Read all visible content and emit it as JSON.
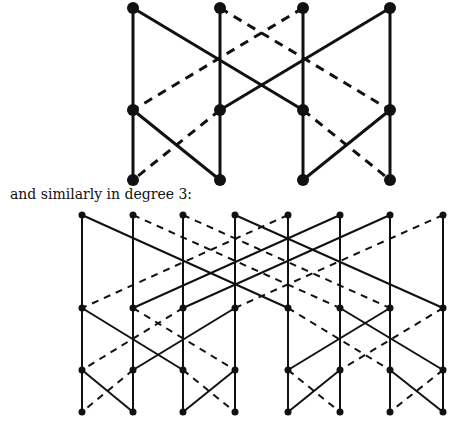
{
  "caption": "and similarly in degree 3:",
  "colors": {
    "ink": "#111111",
    "background": "#ffffff"
  },
  "diagrams": [
    {
      "name": "degree-2",
      "node_radius": 6,
      "stroke_width": 3,
      "dash": "9,7",
      "columns": [
        133,
        220,
        303,
        390
      ],
      "rows": [
        8,
        110,
        180
      ],
      "edges": [
        {
          "from": [
            0,
            0
          ],
          "to": [
            0,
            1
          ],
          "style": "solid"
        },
        {
          "from": [
            0,
            1
          ],
          "to": [
            0,
            2
          ],
          "style": "solid"
        },
        {
          "from": [
            1,
            0
          ],
          "to": [
            1,
            1
          ],
          "style": "solid"
        },
        {
          "from": [
            1,
            1
          ],
          "to": [
            1,
            2
          ],
          "style": "solid"
        },
        {
          "from": [
            2,
            0
          ],
          "to": [
            2,
            1
          ],
          "style": "solid"
        },
        {
          "from": [
            2,
            1
          ],
          "to": [
            2,
            2
          ],
          "style": "solid"
        },
        {
          "from": [
            3,
            0
          ],
          "to": [
            3,
            1
          ],
          "style": "solid"
        },
        {
          "from": [
            3,
            1
          ],
          "to": [
            3,
            2
          ],
          "style": "solid"
        },
        {
          "from": [
            0,
            0
          ],
          "to": [
            2,
            1
          ],
          "style": "solid"
        },
        {
          "from": [
            3,
            0
          ],
          "to": [
            1,
            1
          ],
          "style": "solid"
        },
        {
          "from": [
            1,
            0
          ],
          "to": [
            3,
            1
          ],
          "style": "dashed"
        },
        {
          "from": [
            2,
            0
          ],
          "to": [
            0,
            1
          ],
          "style": "dashed"
        },
        {
          "from": [
            0,
            1
          ],
          "to": [
            1,
            2
          ],
          "style": "solid"
        },
        {
          "from": [
            1,
            1
          ],
          "to": [
            0,
            2
          ],
          "style": "dashed"
        },
        {
          "from": [
            3,
            1
          ],
          "to": [
            2,
            2
          ],
          "style": "solid"
        },
        {
          "from": [
            2,
            1
          ],
          "to": [
            3,
            2
          ],
          "style": "dashed"
        }
      ]
    },
    {
      "name": "degree-3",
      "node_radius": 3.5,
      "stroke_width": 2,
      "dash": "7,6",
      "columns": [
        82,
        133,
        183,
        235,
        288,
        340,
        390,
        443
      ],
      "rows": [
        215,
        308,
        370,
        412
      ],
      "edges": [
        {
          "from": [
            0,
            0
          ],
          "to": [
            0,
            1
          ],
          "style": "solid"
        },
        {
          "from": [
            0,
            1
          ],
          "to": [
            0,
            2
          ],
          "style": "solid"
        },
        {
          "from": [
            0,
            2
          ],
          "to": [
            0,
            3
          ],
          "style": "solid"
        },
        {
          "from": [
            1,
            0
          ],
          "to": [
            1,
            1
          ],
          "style": "solid"
        },
        {
          "from": [
            1,
            1
          ],
          "to": [
            1,
            2
          ],
          "style": "solid"
        },
        {
          "from": [
            1,
            2
          ],
          "to": [
            1,
            3
          ],
          "style": "solid"
        },
        {
          "from": [
            2,
            0
          ],
          "to": [
            2,
            1
          ],
          "style": "solid"
        },
        {
          "from": [
            2,
            1
          ],
          "to": [
            2,
            2
          ],
          "style": "solid"
        },
        {
          "from": [
            2,
            2
          ],
          "to": [
            2,
            3
          ],
          "style": "solid"
        },
        {
          "from": [
            3,
            0
          ],
          "to": [
            3,
            1
          ],
          "style": "solid"
        },
        {
          "from": [
            3,
            1
          ],
          "to": [
            3,
            2
          ],
          "style": "solid"
        },
        {
          "from": [
            3,
            2
          ],
          "to": [
            3,
            3
          ],
          "style": "solid"
        },
        {
          "from": [
            4,
            0
          ],
          "to": [
            4,
            1
          ],
          "style": "solid"
        },
        {
          "from": [
            4,
            1
          ],
          "to": [
            4,
            2
          ],
          "style": "solid"
        },
        {
          "from": [
            4,
            2
          ],
          "to": [
            4,
            3
          ],
          "style": "solid"
        },
        {
          "from": [
            5,
            0
          ],
          "to": [
            5,
            1
          ],
          "style": "solid"
        },
        {
          "from": [
            5,
            1
          ],
          "to": [
            5,
            2
          ],
          "style": "solid"
        },
        {
          "from": [
            5,
            2
          ],
          "to": [
            5,
            3
          ],
          "style": "solid"
        },
        {
          "from": [
            6,
            0
          ],
          "to": [
            6,
            1
          ],
          "style": "solid"
        },
        {
          "from": [
            6,
            1
          ],
          "to": [
            6,
            2
          ],
          "style": "solid"
        },
        {
          "from": [
            6,
            2
          ],
          "to": [
            6,
            3
          ],
          "style": "solid"
        },
        {
          "from": [
            7,
            0
          ],
          "to": [
            7,
            1
          ],
          "style": "solid"
        },
        {
          "from": [
            7,
            1
          ],
          "to": [
            7,
            2
          ],
          "style": "solid"
        },
        {
          "from": [
            7,
            2
          ],
          "to": [
            7,
            3
          ],
          "style": "solid"
        },
        {
          "from": [
            0,
            0
          ],
          "to": [
            4,
            1
          ],
          "style": "solid"
        },
        {
          "from": [
            1,
            0
          ],
          "to": [
            5,
            1
          ],
          "style": "dashed"
        },
        {
          "from": [
            2,
            0
          ],
          "to": [
            6,
            1
          ],
          "style": "dashed"
        },
        {
          "from": [
            3,
            0
          ],
          "to": [
            7,
            1
          ],
          "style": "solid"
        },
        {
          "from": [
            4,
            0
          ],
          "to": [
            0,
            1
          ],
          "style": "dashed"
        },
        {
          "from": [
            5,
            0
          ],
          "to": [
            1,
            1
          ],
          "style": "solid"
        },
        {
          "from": [
            6,
            0
          ],
          "to": [
            2,
            1
          ],
          "style": "solid"
        },
        {
          "from": [
            7,
            0
          ],
          "to": [
            3,
            1
          ],
          "style": "dashed"
        },
        {
          "from": [
            0,
            1
          ],
          "to": [
            2,
            2
          ],
          "style": "solid"
        },
        {
          "from": [
            3,
            1
          ],
          "to": [
            1,
            2
          ],
          "style": "solid"
        },
        {
          "from": [
            1,
            1
          ],
          "to": [
            3,
            2
          ],
          "style": "dashed"
        },
        {
          "from": [
            2,
            1
          ],
          "to": [
            0,
            2
          ],
          "style": "dashed"
        },
        {
          "from": [
            5,
            1
          ],
          "to": [
            7,
            2
          ],
          "style": "solid"
        },
        {
          "from": [
            6,
            1
          ],
          "to": [
            4,
            2
          ],
          "style": "solid"
        },
        {
          "from": [
            4,
            1
          ],
          "to": [
            6,
            2
          ],
          "style": "dashed"
        },
        {
          "from": [
            7,
            1
          ],
          "to": [
            5,
            2
          ],
          "style": "dashed"
        },
        {
          "from": [
            0,
            2
          ],
          "to": [
            1,
            3
          ],
          "style": "solid"
        },
        {
          "from": [
            1,
            2
          ],
          "to": [
            0,
            3
          ],
          "style": "dashed"
        },
        {
          "from": [
            3,
            2
          ],
          "to": [
            2,
            3
          ],
          "style": "solid"
        },
        {
          "from": [
            2,
            2
          ],
          "to": [
            3,
            3
          ],
          "style": "dashed"
        },
        {
          "from": [
            5,
            2
          ],
          "to": [
            4,
            3
          ],
          "style": "solid"
        },
        {
          "from": [
            4,
            2
          ],
          "to": [
            5,
            3
          ],
          "style": "dashed"
        },
        {
          "from": [
            6,
            2
          ],
          "to": [
            7,
            3
          ],
          "style": "solid"
        },
        {
          "from": [
            7,
            2
          ],
          "to": [
            6,
            3
          ],
          "style": "dashed"
        }
      ]
    }
  ]
}
